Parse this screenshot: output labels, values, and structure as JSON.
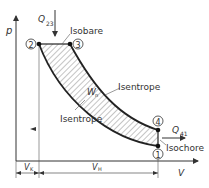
{
  "diagram": {
    "type": "p-V diagram (Otto cycle)",
    "axes": {
      "y_label": "p",
      "x_label": "V"
    },
    "points": [
      {
        "id": "1",
        "label": "1"
      },
      {
        "id": "2",
        "label": "2"
      },
      {
        "id": "3",
        "label": "3"
      },
      {
        "id": "4",
        "label": "4"
      }
    ],
    "labels": {
      "heat_in": "Q",
      "heat_in_sub": "23",
      "heat_out": "Q",
      "heat_out_sub": "41",
      "isobare": "Isobare",
      "isentrope_upper": "Isentrope",
      "isentrope_lower": "Isentrope",
      "isochore": "Isochore",
      "work": "W",
      "work_sub": "n",
      "vk": "V",
      "vk_sub": "K",
      "vh": "V",
      "vh_sub": "H"
    },
    "colors": {
      "line": "#333333",
      "hatch": "#555555"
    }
  }
}
